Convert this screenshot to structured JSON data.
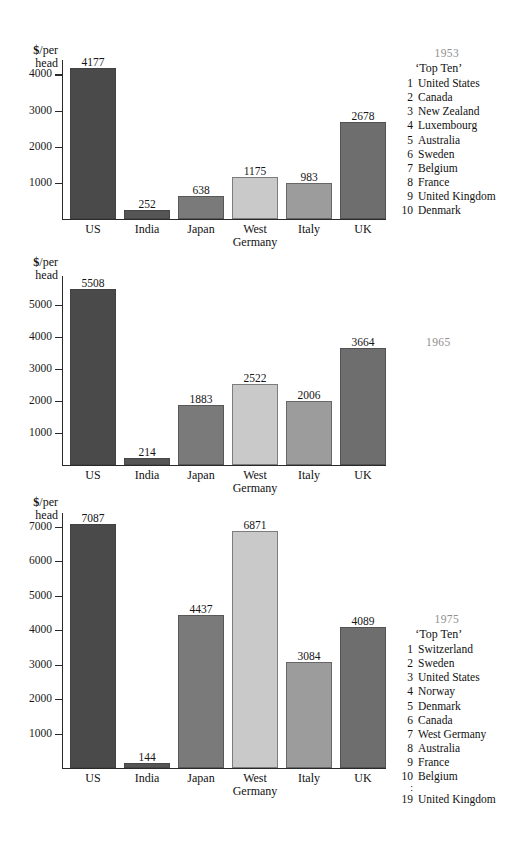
{
  "figure": {
    "axis_title_line1": "$/per",
    "axis_title_line2": "head",
    "currency_symbol": "$",
    "axis_title_rest": "/per",
    "categories": [
      "US",
      "India",
      "Japan",
      "West\nGermany",
      "Italy",
      "UK"
    ],
    "bar_colors": {
      "US": "#4a4a4a",
      "India": "#555555",
      "Japan": "#7a7a7a",
      "West Germany": "#c9c9c9",
      "Italy": "#9c9c9c",
      "UK": "#6e6e6e"
    },
    "year_label_color": "#8e8e8e"
  },
  "chart_data": [
    {
      "type": "bar",
      "title": "1953",
      "xlabel": "",
      "ylabel": "$/per head",
      "ylim": [
        0,
        4400
      ],
      "yticks": [
        1000,
        2000,
        3000,
        4000
      ],
      "ytick_labels": [
        "1000",
        "2000",
        "3000",
        "4000"
      ],
      "grid": false,
      "categories": [
        "US",
        "India",
        "Japan",
        "West Germany",
        "Italy",
        "UK"
      ],
      "values": [
        4177,
        252,
        638,
        1175,
        983,
        2678
      ],
      "value_labels": [
        "4177",
        "252",
        "638",
        "1175",
        "983",
        "2678"
      ]
    },
    {
      "type": "bar",
      "title": "1965",
      "xlabel": "",
      "ylabel": "$/per head",
      "ylim": [
        0,
        5900
      ],
      "yticks": [
        1000,
        2000,
        3000,
        4000,
        5000
      ],
      "ytick_labels": [
        "1000",
        "2000",
        "3000",
        "4000",
        "5000"
      ],
      "grid": false,
      "categories": [
        "US",
        "India",
        "Japan",
        "West Germany",
        "Italy",
        "UK"
      ],
      "values": [
        5508,
        214,
        1883,
        2522,
        2006,
        3664
      ],
      "value_labels": [
        "5508",
        "214",
        "1883",
        "2522",
        "2006",
        "3664"
      ]
    },
    {
      "type": "bar",
      "title": "1975",
      "xlabel": "",
      "ylabel": "$/per head",
      "ylim": [
        0,
        7400
      ],
      "yticks": [
        1000,
        2000,
        3000,
        4000,
        5000,
        6000,
        7000
      ],
      "ytick_labels": [
        "1000",
        "2000",
        "3000",
        "4000",
        "5000",
        "6000",
        "7000"
      ],
      "grid": false,
      "categories": [
        "US",
        "India",
        "Japan",
        "West Germany",
        "Italy",
        "UK"
      ],
      "values": [
        7087,
        144,
        4437,
        6871,
        3084,
        4089
      ],
      "value_labels": [
        "7087",
        "144",
        "4437",
        "6871",
        "3084",
        "4089"
      ]
    }
  ],
  "legends": [
    {
      "year": "1953",
      "heading": "‘Top Ten’",
      "entries": [
        {
          "rank": "1",
          "name": "United States"
        },
        {
          "rank": "2",
          "name": "Canada"
        },
        {
          "rank": "3",
          "name": "New Zealand"
        },
        {
          "rank": "4",
          "name": "Luxembourg"
        },
        {
          "rank": "5",
          "name": "Australia"
        },
        {
          "rank": "6",
          "name": "Sweden"
        },
        {
          "rank": "7",
          "name": "Belgium"
        },
        {
          "rank": "8",
          "name": "France"
        },
        {
          "rank": "9",
          "name": "United Kingdom"
        },
        {
          "rank": "10",
          "name": "Denmark"
        }
      ]
    },
    {
      "year": "1965",
      "heading": "",
      "entries": []
    },
    {
      "year": "1975",
      "heading": "‘Top Ten’",
      "entries": [
        {
          "rank": "1",
          "name": "Switzerland"
        },
        {
          "rank": "2",
          "name": "Sweden"
        },
        {
          "rank": "3",
          "name": "United States"
        },
        {
          "rank": "4",
          "name": "Norway"
        },
        {
          "rank": "5",
          "name": "Denmark"
        },
        {
          "rank": "6",
          "name": "Canada"
        },
        {
          "rank": "7",
          "name": "West Germany"
        },
        {
          "rank": "8",
          "name": "Australia"
        },
        {
          "rank": "9",
          "name": "France"
        },
        {
          "rank": "10",
          "name": "Belgium"
        },
        {
          "rank": ":",
          "name": ""
        },
        {
          "rank": "19",
          "name": "United Kingdom"
        }
      ]
    }
  ]
}
